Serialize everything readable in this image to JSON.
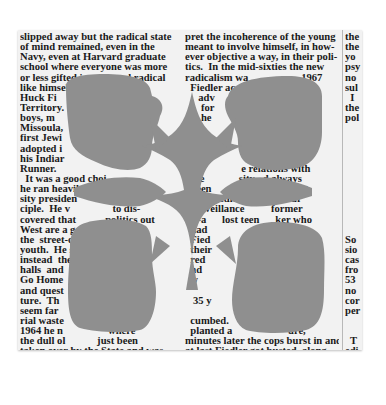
{
  "document": {
    "type": "newspaper-clipping",
    "columns": [
      {
        "lines": [
          "slipped away but the radical state",
          "of mind remained, even in the",
          "Navy, even at Harvard graduate",
          "school where everyone was more",
          "or less gifted intense and radical",
          "like himself                hero.",
          "Huck Fi                  r",
          "Territory.                co",
          "boys, m                 s o",
          "Missoula,",
          "first Jewi",
          "adopted i",
          "his Indiar",
          "Runner.",
          "  It was a good choi",
          "he ran heavily        rai",
          "sity presiden        matter of",
          "ciple.  He v                to dis-",
          "covered that           politics out",
          "West are a go       ocal     tle",
          "the  street-cor    r    b",
          "youth.  He still did",
          "instead  the                     s",
          "halls  and",
          "Go Home",
          "and quest",
          "ture.  Th                    an to",
          "seem far                   ndu",
          "rial waste                 So",
          "1964 he n                 where",
          "the dull ol            just been",
          "taken over by the State and was",
          "now, he says, 'loaded with dough",
          "and flushed with the enthusiasm of",
          "an institution all of whose mistakes",
          "lie ahead of it.'"
        ]
      },
      {
        "lines": [
          "pret the incoherence of the young",
          "meant to involve himself, in how-",
          "ever objective a way, in their poli-",
          "tics.  In the mid-sixties the new",
          "radicalism wa                    1967",
          "  Fiedler acc                n of",
          "     adv                     organ-",
          "      for                      was",
          "      he                       was",
          "     y.                        and",
          "      r",
          "   At                         Mon-",
          "   a-s                       again",
          "  a d              e relations with",
          "  the             sity   d always",
          "  been       moved      ey kept",
          "  the  Fiedler         24-hour",
          "  surveillance          former",
          "  —a      lost teen      ker who",
          "  had                one of the",
          "  Fied            he even attended",
          "  their           er service while",
          "  red                   e in a",
          "  nd                       ronic",
          "  w                          the",
          "                              ns.",
          "   35 y                    ranted",
          "                             ence",
          "  cumbed.                  same,",
          "  planted a                     ure,",
          "minutes later the cops burst in and",
          "at last Fiedler got busted, along",
          "with two sons and his wife. In the",
          "malicious nightmare that followed,",
          "his insurance and credit facilities"
        ]
      },
      {
        "lines": [
          "the",
          "the",
          "yo",
          "psy",
          "no",
          "sul",
          "  I",
          "the",
          "pol",
          "",
          "",
          "",
          "",
          "",
          "",
          "",
          "",
          "",
          "",
          "",
          "So",
          "sio",
          "cas",
          "fro",
          "53",
          "no",
          "cor",
          "per",
          "",
          "",
          "  T",
          "edi",
          "Pe",
          "J.",
          "Ed"
        ]
      }
    ]
  },
  "redaction_overlay": {
    "color": "#8f8f8f",
    "pattern": "four-lobed ornamental cross"
  },
  "colors": {
    "page_background": "#ffffff",
    "paper": "#f2f2f2",
    "ink": "#1a1a1a",
    "overlay": "#8f8f8f"
  }
}
